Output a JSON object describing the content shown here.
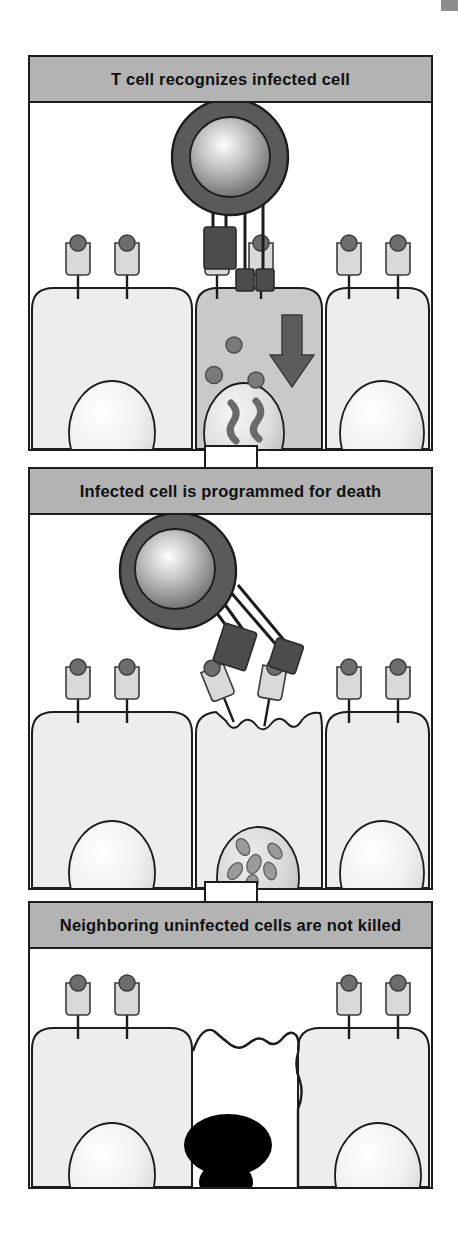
{
  "figure": {
    "panel_count": 3,
    "colors": {
      "header_bar": "#b3b3b3",
      "frame_border": "#1c1c1c",
      "tcell_cytoplasm": "#5a5a5a",
      "tcell_nucleus_center": "#f2f2f2",
      "tcell_nucleus_edge": "#6e6e6e",
      "epithelial_fill": "#ededed",
      "infected_cell_fill": "#c9c9c9",
      "mhc_body": "#d9d9d9",
      "mhc_head": "#6d6d6d",
      "receptor_block": "#4c4c4c",
      "virus_particle": "#7a7a7a",
      "viral_dna": "#6a6a6a",
      "apoptotic_remnant": "#000000",
      "connector_arrow_fill": "#ffffff",
      "page_background": "#ffffff",
      "corner_mark": "#8d8d8d"
    }
  },
  "panels": [
    {
      "id": "panel-recognition",
      "title": "T cell recognizes infected cell",
      "step": 1,
      "tcell": {
        "label": "cytotoxic T cell",
        "state": "attached",
        "receptor_count": 4
      },
      "epithelium": {
        "cell_count": 3,
        "infected_index": 1,
        "mhc_per_cell": 2
      },
      "infected_cell": {
        "virus_particles": 3,
        "viral_dna_strands": 2,
        "signal_arrow": "downward-arrow-into-infected-cell"
      }
    },
    {
      "id": "panel-programmed-death",
      "title": "Infected cell is programmed for death",
      "step": 2,
      "tcell": {
        "label": "cytotoxic T cell",
        "state": "detaching",
        "receptor_count": 2
      },
      "epithelium": {
        "cell_count": 3,
        "infected_index": 1,
        "mhc_per_cell": 2,
        "membrane_state": "blebbing"
      },
      "infected_cell": {
        "nucleus_state": "fragmenting",
        "chromatin_clumps": 6
      }
    },
    {
      "id": "panel-neighbors-spared",
      "title": "Neighboring uninfected cells are not killed",
      "step": 3,
      "tcell": {
        "label": "cytotoxic T cell",
        "state": "absent",
        "receptor_count": 0
      },
      "epithelium": {
        "cell_count": 2,
        "infected_index": null,
        "mhc_per_cell": 2,
        "membrane_state": "intact"
      },
      "apoptotic_body": {
        "label": "apoptotic remnant of killed cell",
        "lobes": 2
      }
    }
  ],
  "connectors": [
    {
      "id": "connector-1-to-2",
      "shape": "hollow-down-arrow"
    },
    {
      "id": "connector-2-to-3",
      "shape": "hollow-down-arrow"
    }
  ]
}
